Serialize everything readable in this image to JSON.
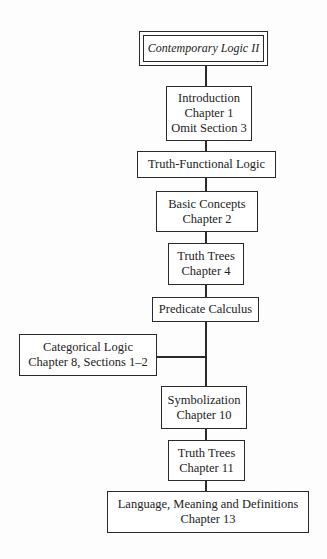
{
  "title": "Contemporary Logic II",
  "nodes": [
    {
      "id": "intro",
      "lines": [
        "Introduction",
        "Chapter 1",
        "Omit Section 3"
      ]
    },
    {
      "id": "tfl",
      "lines": [
        "Truth-Functional Logic"
      ]
    },
    {
      "id": "basic",
      "lines": [
        "Basic Concepts",
        "Chapter 2"
      ]
    },
    {
      "id": "tt4",
      "lines": [
        "Truth Trees",
        "Chapter 4"
      ]
    },
    {
      "id": "pred",
      "lines": [
        "Predicate Calculus"
      ]
    },
    {
      "id": "cat",
      "lines": [
        "Categorical Logic",
        "Chapter 8, Sections 1–2"
      ]
    },
    {
      "id": "sym",
      "lines": [
        "Symbolization",
        "Chapter 10"
      ]
    },
    {
      "id": "tt11",
      "lines": [
        "Truth Trees",
        "Chapter 11"
      ]
    },
    {
      "id": "lang",
      "lines": [
        "Language, Meaning and Definitions",
        "Chapter 13"
      ]
    }
  ],
  "colors": {
    "stroke": "#2a2a2a",
    "text": "#222222",
    "background": "#fdfdfd"
  }
}
